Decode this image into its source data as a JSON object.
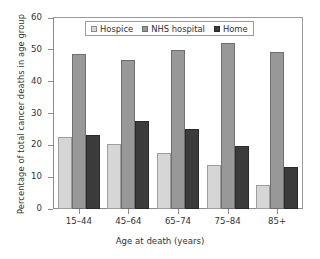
{
  "chart_data": {
    "type": "bar",
    "title": "",
    "xlabel": "Age at death (years)",
    "ylabel": "Percentage of total cancer deaths in age group",
    "categories": [
      "15–44",
      "45–64",
      "65–74",
      "75–84",
      "85+"
    ],
    "series": [
      {
        "name": "Hospice",
        "color": "#d6d6d6",
        "values": [
          22.5,
          20.5,
          17.6,
          13.8,
          7.6
        ]
      },
      {
        "name": "NHS hospital",
        "color": "#989898",
        "values": [
          48.7,
          46.8,
          49.8,
          52.2,
          49.2
        ]
      },
      {
        "name": "Home",
        "color": "#3b3b3b",
        "values": [
          23.3,
          27.8,
          25.2,
          19.8,
          13.1
        ]
      }
    ],
    "ylim": [
      0,
      60
    ],
    "yticks": [
      0,
      10,
      20,
      30,
      40,
      50,
      60
    ],
    "ytick_labels": [
      "0",
      "10",
      "20",
      "30",
      "40",
      "50",
      "60"
    ],
    "grid": false,
    "legend_position": "top-center",
    "legend_entries": [
      "Hospice",
      "NHS hospital",
      "Home"
    ]
  }
}
